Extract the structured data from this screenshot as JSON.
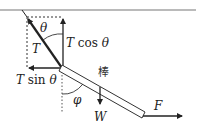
{
  "diagram": {
    "type": "physics-force-decomposition",
    "labels": {
      "tension": "T",
      "tension_vertical_T": "T",
      "tension_vertical_fn": " cos ",
      "tension_vertical_theta": "θ",
      "tension_horizontal_T": "T",
      "tension_horizontal_fn": " sin ",
      "tension_horizontal_theta": "θ",
      "angle_theta": "θ",
      "angle_phi": "φ",
      "weight": "W",
      "force": "F",
      "rod": "棒"
    },
    "colors": {
      "line": "#222222",
      "ceiling": "#777777",
      "dashed": "#333333",
      "background": "#ffffff"
    }
  }
}
